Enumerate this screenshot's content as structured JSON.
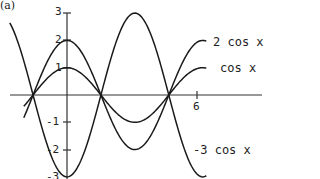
{
  "panel_label": "(a)",
  "chart_data": {
    "type": "line",
    "title": "",
    "xlabel": "",
    "ylabel": "",
    "xlim": [
      -2.65,
      6.6
    ],
    "ylim": [
      -3,
      3
    ],
    "grid": false,
    "x_ticks": [
      {
        "value": 6,
        "label": "6"
      }
    ],
    "y_ticks": [
      {
        "value": 3,
        "label": "3"
      },
      {
        "value": 2,
        "label": "2"
      },
      {
        "value": 1,
        "label": "1"
      },
      {
        "value": -1,
        "label": "-1"
      },
      {
        "value": -2,
        "label": "-2"
      },
      {
        "value": -3,
        "label": "-3"
      }
    ],
    "series": [
      {
        "name": "2 cos x",
        "function": "2*cos(x)",
        "amplitude": 2,
        "x_range": [
          -2.0,
          6.45
        ]
      },
      {
        "name": "cos x",
        "function": "cos(x)",
        "amplitude": 1,
        "x_range": [
          -2.0,
          6.45
        ]
      },
      {
        "name": "-3 cos x",
        "function": "-3*cos(x)",
        "amplitude": -3,
        "x_range": [
          -2.65,
          6.45
        ]
      }
    ],
    "legend": "inline labels at right end of each curve",
    "annotations": [
      "2 cos x",
      "cos x",
      "-3 cos x"
    ]
  },
  "labels": {
    "two_cos": "2 cos x",
    "cos": "cos x",
    "neg_three_cos": "-3 cos x"
  },
  "ticks": {
    "y3": "3",
    "y2": "2",
    "y1": "1",
    "ym1": "-1",
    "ym2": "-2",
    "ym3": "-3",
    "x6": "6"
  },
  "colors": {
    "line": "#1a1a1a",
    "axis": "#333333",
    "background": "#ffffff"
  }
}
